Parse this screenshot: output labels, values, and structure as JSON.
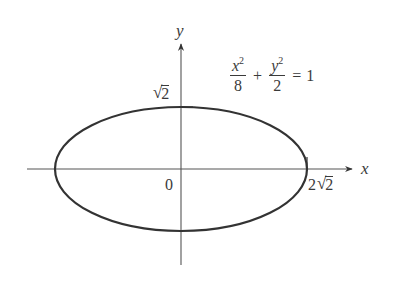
{
  "figure": {
    "type": "ellipse-graph",
    "equation": {
      "term1": {
        "numerator_var": "x",
        "numerator_exp": "2",
        "denominator": "8"
      },
      "plus": "+",
      "term2": {
        "numerator_var": "y",
        "numerator_exp": "2",
        "denominator": "2"
      },
      "equals": "=",
      "rhs": "1"
    },
    "axes": {
      "x_label": "x",
      "y_label": "y"
    },
    "labels": {
      "origin": "0",
      "y_intercept": {
        "coefficient": "",
        "radical": "√",
        "radicand": "2"
      },
      "x_intercept": {
        "coefficient": "2",
        "radical": "√",
        "radicand": "2"
      }
    },
    "ellipse": {
      "semi_major_axis": "2√2",
      "semi_minor_axis": "√2",
      "stroke_color": "#333333"
    },
    "colors": {
      "axis": "#555555",
      "curve": "#333333",
      "text": "#3a3a3a",
      "background": "#ffffff"
    }
  }
}
